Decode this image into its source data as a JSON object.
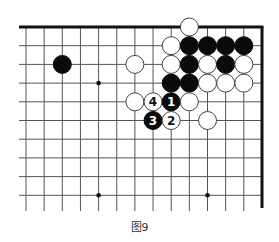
{
  "diagram": {
    "type": "go-board-diagram",
    "caption": "图9",
    "board": {
      "columns_visible": 13,
      "rows_visible": 10,
      "edges": [
        "top",
        "right"
      ],
      "line_color": "#555555",
      "edge_color": "#111111"
    },
    "star_points": [
      {
        "col": 4,
        "row": 3
      },
      {
        "col": 4,
        "row": 9
      },
      {
        "col": 10,
        "row": 9
      }
    ],
    "stones": [
      {
        "color": "white",
        "col": 9,
        "row": 0,
        "label": ""
      },
      {
        "color": "white",
        "col": 8,
        "row": 1,
        "label": ""
      },
      {
        "color": "black",
        "col": 9,
        "row": 1,
        "label": ""
      },
      {
        "color": "black",
        "col": 10,
        "row": 1,
        "label": ""
      },
      {
        "color": "black",
        "col": 11,
        "row": 1,
        "label": ""
      },
      {
        "color": "black",
        "col": 12,
        "row": 1,
        "label": ""
      },
      {
        "color": "black",
        "col": 2,
        "row": 2,
        "label": ""
      },
      {
        "color": "white",
        "col": 6,
        "row": 2,
        "label": ""
      },
      {
        "color": "white",
        "col": 8,
        "row": 2,
        "label": ""
      },
      {
        "color": "black",
        "col": 9,
        "row": 2,
        "label": ""
      },
      {
        "color": "white",
        "col": 10,
        "row": 2,
        "label": ""
      },
      {
        "color": "black",
        "col": 11,
        "row": 2,
        "label": ""
      },
      {
        "color": "white",
        "col": 12,
        "row": 2,
        "label": ""
      },
      {
        "color": "black",
        "col": 8,
        "row": 3,
        "label": ""
      },
      {
        "color": "black",
        "col": 9,
        "row": 3,
        "label": ""
      },
      {
        "color": "white",
        "col": 10,
        "row": 3,
        "label": ""
      },
      {
        "color": "white",
        "col": 11,
        "row": 3,
        "label": ""
      },
      {
        "color": "white",
        "col": 12,
        "row": 3,
        "label": ""
      },
      {
        "color": "white",
        "col": 6,
        "row": 4,
        "label": ""
      },
      {
        "color": "white",
        "col": 7,
        "row": 4,
        "label": "4"
      },
      {
        "color": "black",
        "col": 8,
        "row": 4,
        "label": "1"
      },
      {
        "color": "white",
        "col": 9,
        "row": 4,
        "label": ""
      },
      {
        "color": "black",
        "col": 7,
        "row": 5,
        "label": "3"
      },
      {
        "color": "white",
        "col": 8,
        "row": 5,
        "label": "2"
      },
      {
        "color": "white",
        "col": 10,
        "row": 5,
        "label": ""
      }
    ]
  }
}
